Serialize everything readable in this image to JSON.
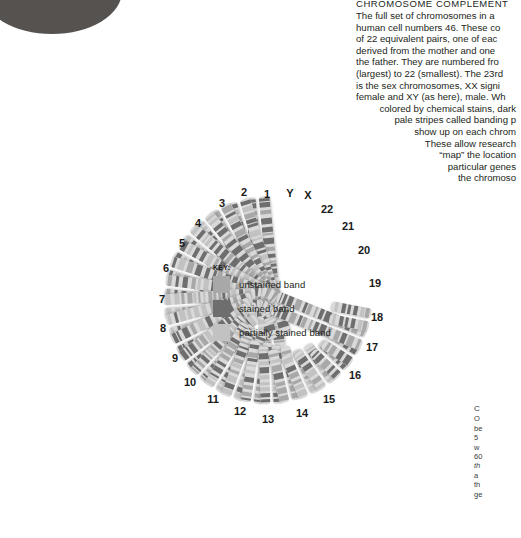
{
  "figure": {
    "name": "human-karyotype-chromosome-complement",
    "background": "#ffffff"
  },
  "nucleus": {
    "label": "cell-nucleus",
    "color_top": "#6b6866",
    "color_body": "#55524f"
  },
  "article": {
    "title": "CHROMOSOME COMPLEMENT",
    "lines": [
      "The full set of chromosomes in a",
      "human cell numbers 46. These co",
      "of 22 equivalent pairs, one of eac",
      "derived from the mother and one",
      "the father. They are numbered fro",
      "(largest) to 22 (smallest). The 23rd",
      "is the sex chromosomes, XX signi",
      "female and XY (as here), male. Wh",
      "colored by chemical stains, dark",
      "pale stripes called banding p",
      "show up on each chrom",
      "These allow research",
      "“map” the location",
      "particular genes",
      "the chromoso"
    ]
  },
  "caption": {
    "title": "C",
    "lines": [
      "O",
      "be",
      "5",
      "w",
      "60",
      "th",
      "a",
      "th",
      "ge"
    ]
  },
  "key": {
    "title": "KEY:",
    "items": [
      {
        "label": "unstained band",
        "color": "#a8a8a8",
        "swatch_name": "unstained-band-swatch"
      },
      {
        "label": "stained band",
        "color": "#6e6e6e",
        "swatch_name": "stained-band-swatch"
      },
      {
        "label": "partially stained band",
        "color": "#c2c2c2",
        "swatch_name": "partially-stained-band-swatch"
      }
    ]
  },
  "karyotype": {
    "labels": [
      {
        "text": "1",
        "x": 267,
        "y": 194
      },
      {
        "text": "2",
        "x": 244,
        "y": 192
      },
      {
        "text": "3",
        "x": 222,
        "y": 203
      },
      {
        "text": "4",
        "x": 198,
        "y": 223
      },
      {
        "text": "5",
        "x": 182,
        "y": 243
      },
      {
        "text": "6",
        "x": 166,
        "y": 268
      },
      {
        "text": "7",
        "x": 162,
        "y": 299
      },
      {
        "text": "8",
        "x": 163,
        "y": 328
      },
      {
        "text": "9",
        "x": 175,
        "y": 358
      },
      {
        "text": "10",
        "x": 190,
        "y": 382
      },
      {
        "text": "11",
        "x": 213,
        "y": 399
      },
      {
        "text": "12",
        "x": 240,
        "y": 411
      },
      {
        "text": "13",
        "x": 268,
        "y": 419
      },
      {
        "text": "14",
        "x": 302,
        "y": 413
      },
      {
        "text": "15",
        "x": 329,
        "y": 399
      },
      {
        "text": "16",
        "x": 355,
        "y": 375
      },
      {
        "text": "17",
        "x": 372,
        "y": 347
      },
      {
        "text": "18",
        "x": 377,
        "y": 317
      },
      {
        "text": "19",
        "x": 375,
        "y": 283
      },
      {
        "text": "20",
        "x": 364,
        "y": 250
      },
      {
        "text": "21",
        "x": 348,
        "y": 226
      },
      {
        "text": "22",
        "x": 327,
        "y": 209
      },
      {
        "text": "X",
        "x": 308,
        "y": 195
      },
      {
        "text": "Y",
        "x": 290,
        "y": 193
      }
    ],
    "pairs": [
      {
        "id": "1",
        "angle": -6,
        "len": 150,
        "w": 11
      },
      {
        "id": "2",
        "angle": -17,
        "len": 142,
        "w": 11
      },
      {
        "id": "3",
        "angle": -28,
        "len": 126,
        "w": 11
      },
      {
        "id": "4",
        "angle": -39,
        "len": 118,
        "w": 11
      },
      {
        "id": "5",
        "angle": -50,
        "len": 114,
        "w": 11
      },
      {
        "id": "6",
        "angle": -61,
        "len": 106,
        "w": 11
      },
      {
        "id": "7",
        "angle": -72,
        "len": 100,
        "w": 11
      },
      {
        "id": "8",
        "angle": -83,
        "len": 96,
        "w": 11
      },
      {
        "id": "9",
        "angle": -94,
        "len": 92,
        "w": 11
      },
      {
        "id": "10",
        "angle": -105,
        "len": 88,
        "w": 11
      },
      {
        "id": "11",
        "angle": -116,
        "len": 86,
        "w": 11
      },
      {
        "id": "12",
        "angle": -127,
        "len": 84,
        "w": 11
      },
      {
        "id": "13",
        "angle": -138,
        "len": 74,
        "w": 10
      },
      {
        "id": "14",
        "angle": -149,
        "len": 72,
        "w": 10
      },
      {
        "id": "15",
        "angle": -160,
        "len": 70,
        "w": 10
      },
      {
        "id": "16",
        "angle": -171,
        "len": 62,
        "w": 10
      },
      {
        "id": "17",
        "angle": 178,
        "len": 58,
        "w": 10
      },
      {
        "id": "18",
        "angle": 167,
        "len": 54,
        "w": 10
      },
      {
        "id": "19",
        "angle": 156,
        "len": 46,
        "w": 10
      },
      {
        "id": "20",
        "angle": 145,
        "len": 44,
        "w": 10
      },
      {
        "id": "21",
        "angle": 134,
        "len": 36,
        "w": 10
      },
      {
        "id": "22",
        "angle": 123,
        "len": 34,
        "w": 10
      },
      {
        "id": "X",
        "angle": 112,
        "len": 96,
        "w": 11
      },
      {
        "id": "Y",
        "angle": 101,
        "len": 40,
        "w": 10
      }
    ],
    "center": {
      "x": 268,
      "y": 300
    },
    "inner_radius": 104
  }
}
